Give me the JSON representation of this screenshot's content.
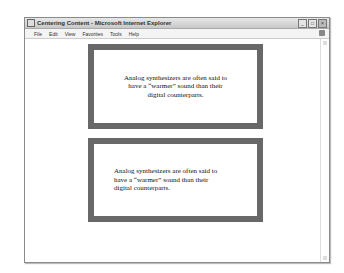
{
  "window": {
    "title": "Centering Content - Microsoft Internet Explorer",
    "controls": {
      "minimize": "_",
      "maximize": "□",
      "close": "×"
    }
  },
  "menubar": {
    "items": [
      {
        "label": "File"
      },
      {
        "label": "Edit"
      },
      {
        "label": "View"
      },
      {
        "label": "Favorites"
      },
      {
        "label": "Tools"
      },
      {
        "label": "Help"
      }
    ]
  },
  "content": {
    "boxes": [
      {
        "text": "Analog synthesizers are often said to have a “warmer” sound than their digital counterparts.",
        "align": "center"
      },
      {
        "text": "Analog synthesizers are often said to have a “warmer” sound than their digital counterparts.",
        "align": "left"
      }
    ],
    "box_border_color": "#686868"
  }
}
